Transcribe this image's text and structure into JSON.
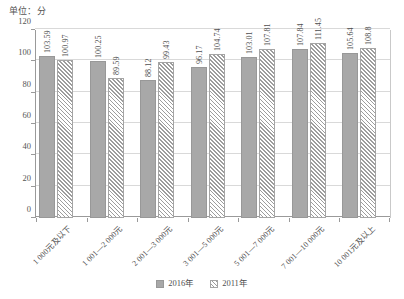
{
  "unit_caption": "单位：分",
  "legend": {
    "position": "bottom-center",
    "items": [
      {
        "label": "2016年",
        "swatch": "solid-gray-swatch",
        "color": "#a8a8a8"
      },
      {
        "label": "2011年",
        "swatch": "hatched-swatch",
        "color": "#9d9d9d"
      }
    ]
  },
  "yaxis": {
    "ticks": [
      "0",
      "20",
      "40",
      "60",
      "80",
      "100",
      "120"
    ]
  },
  "chart_data": {
    "type": "bar",
    "title": "",
    "subtitle": "",
    "xlabel": "",
    "ylabel": "单位：分",
    "ylim": [
      0,
      120
    ],
    "ytick_values": [
      0,
      20,
      40,
      60,
      80,
      100,
      120
    ],
    "grid": true,
    "legend_position": "bottom-center",
    "categories": [
      "1 000元及以下",
      "1 001—2 000元",
      "2 001—3 000元",
      "3 001—5 000元",
      "5 001—7 000元",
      "7 001—10 000元",
      "10 001元及以上"
    ],
    "series": [
      {
        "name": "2016年",
        "values": [
          103.59,
          100.25,
          88.12,
          96.17,
          103.01,
          107.84,
          105.64
        ],
        "labels": [
          "103.59",
          "100.25",
          "88.12",
          "96.17",
          "103.01",
          "107.84",
          "105.64"
        ]
      },
      {
        "name": "2011年",
        "values": [
          100.97,
          89.59,
          99.43,
          104.74,
          107.81,
          111.45,
          108.8
        ],
        "labels": [
          "100.97",
          "89.59",
          "99.43",
          "104.74",
          "107.81",
          "111.45",
          "108.8"
        ]
      }
    ]
  }
}
